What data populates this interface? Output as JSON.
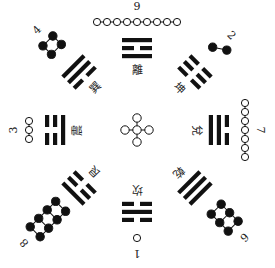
{
  "diagram": {
    "type": "later-heaven-bagua-luoshu",
    "center": {
      "number": "5",
      "dots": 5,
      "dot_style": "white"
    },
    "colors": {
      "ink": "#111111",
      "background": "#ffffff"
    },
    "positions": [
      {
        "id": "top",
        "number": "9",
        "trigram": "離",
        "dots": 9,
        "dot_style": "white",
        "lines": [
          "yang",
          "yin",
          "yang"
        ],
        "angle": 0
      },
      {
        "id": "top-right",
        "number": "2",
        "trigram": "坤",
        "dots": 2,
        "dot_style": "black",
        "lines": [
          "yin",
          "yin",
          "yin"
        ],
        "angle": 45
      },
      {
        "id": "right",
        "number": "7",
        "trigram": "兌",
        "dots": 7,
        "dot_style": "white",
        "lines": [
          "yin",
          "yang",
          "yang"
        ],
        "angle": 90
      },
      {
        "id": "bottom-right",
        "number": "6",
        "trigram": "乾",
        "dots": 6,
        "dot_style": "black",
        "lines": [
          "yang",
          "yang",
          "yang"
        ],
        "angle": 135
      },
      {
        "id": "bottom",
        "number": "1",
        "trigram": "坎",
        "dots": 1,
        "dot_style": "white",
        "lines": [
          "yin",
          "yang",
          "yin"
        ],
        "angle": 180
      },
      {
        "id": "bottom-left",
        "number": "8",
        "trigram": "艮",
        "dots": 8,
        "dot_style": "black",
        "lines": [
          "yang",
          "yin",
          "yin"
        ],
        "angle": 225
      },
      {
        "id": "left",
        "number": "3",
        "trigram": "震",
        "dots": 3,
        "dot_style": "white",
        "lines": [
          "yin",
          "yin",
          "yang"
        ],
        "angle": 270
      },
      {
        "id": "top-left",
        "number": "4",
        "trigram": "巽",
        "dots": 4,
        "dot_style": "black",
        "lines": [
          "yang",
          "yang",
          "yin"
        ],
        "angle": 315
      }
    ]
  }
}
